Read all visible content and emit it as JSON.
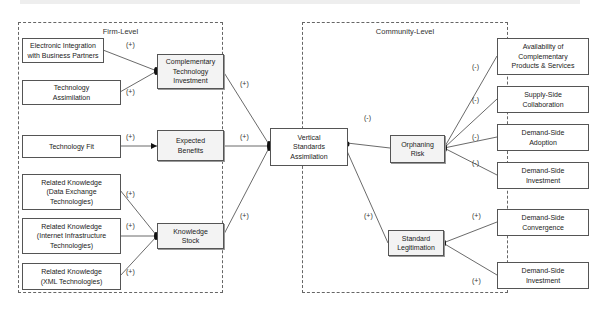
{
  "regions": {
    "firm": {
      "title": "Firm-Level"
    },
    "community": {
      "title": "Community-Level"
    }
  },
  "nodes": {
    "electronic_integration": "Electronic Integration\nwith Business Partners",
    "technology_assimilation": "Technology\nAssimilation",
    "technology_fit": "Technology Fit",
    "rk_data_exchange": "Related Knowledge\n(Data Exchange\nTechnologies)",
    "rk_internet": "Related Knowledge\n(Internet Infrastructure\nTechnologies)",
    "rk_xml": "Related Knowledge\n(XML Technologies)",
    "complementary_investment": "Complementary\nTechnology\nInvestment",
    "expected_benefits": "Expected\nBenefits",
    "knowledge_stock": "Knowledge\nStock",
    "vertical_standards": "Vertical\nStandards\nAssimilation",
    "orphaning_risk": "Orphaning\nRisk",
    "standard_legitimation": "Standard\nLegitimation",
    "availability": "Availability of\nComplementary\nProducts & Services",
    "supply_side_collab": "Supply-Side\nCollaboration",
    "demand_side_adoption": "Demand-Side\nAdoption",
    "demand_side_investment_1": "Demand-Side\nInvestment",
    "demand_side_convergence": "Demand-Side\nConvergence",
    "demand_side_investment_2": "Demand-Side\nInvestment"
  },
  "signs": {
    "ei_cti": "(+)",
    "ta_cti": "(+)",
    "tf_eb": "(+)",
    "rk1_ks": "(+)",
    "rk2_ks": "(+)",
    "rk3_ks": "(+)",
    "cti_vsa": "(+)",
    "eb_vsa": "(+)",
    "ks_vsa": "(+)",
    "or_vsa": "(-)",
    "sl_vsa": "(+)",
    "avail_or": "(-)",
    "ssc_or": "(-)",
    "dsa_or": "(-)",
    "dsi_or": "(-)",
    "dsc_sl": "(+)",
    "dsi_sl": "(+)"
  }
}
